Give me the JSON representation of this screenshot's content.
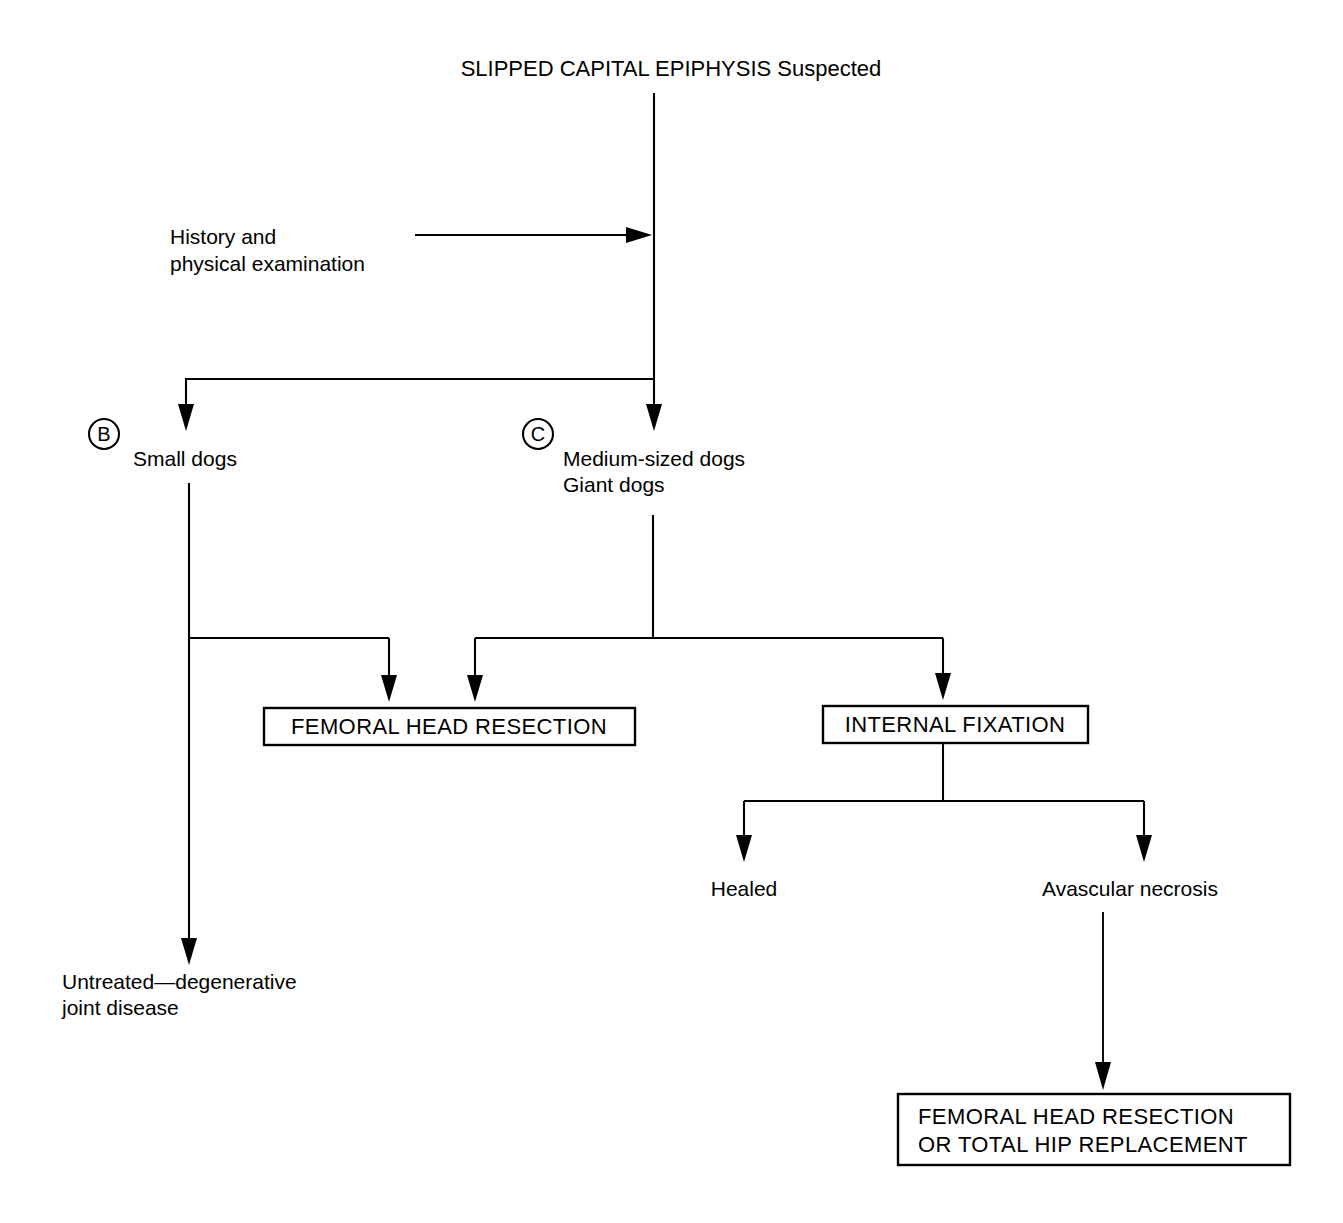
{
  "diagram": {
    "title": "SLIPPED CAPITAL EPIPHYSIS Suspected",
    "type": "clinical-decision-flowchart",
    "background_color": "#ffffff",
    "line_color": "#000000",
    "text_color": "#000000"
  },
  "nodes": {
    "root": "SLIPPED CAPITAL EPIPHYSIS Suspected",
    "assessment_line1": "History and",
    "assessment_line2": "physical examination",
    "branch_b_marker": "B",
    "branch_b_label": "Small dogs",
    "branch_c_marker": "C",
    "branch_c_label_line1": "Medium-sized dogs",
    "branch_c_label_line2": "Giant dogs",
    "treatment_resection": "FEMORAL HEAD RESECTION",
    "treatment_fixation": "INTERNAL FIXATION",
    "outcome_healed": "Healed",
    "outcome_necrosis": "Avascular necrosis",
    "outcome_untreated_line1": "Untreated—degenerative",
    "outcome_untreated_line2": "joint disease",
    "salvage_line1": "FEMORAL HEAD RESECTION",
    "salvage_line2": "OR TOTAL HIP REPLACEMENT"
  }
}
